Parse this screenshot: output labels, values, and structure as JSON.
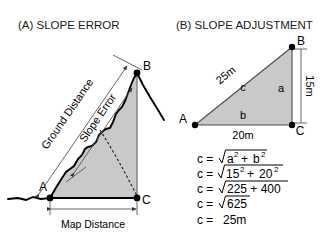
{
  "figure": {
    "background_color": "#ffffff",
    "fill_color": "#c9c9c9",
    "line_color": "#000000"
  },
  "panel_a": {
    "title": "(A) SLOPE ERROR",
    "labels": {
      "ground_distance": "Ground Distance",
      "slope_error": "Slope Error",
      "map_distance": "Map Distance",
      "point_a": "A",
      "point_b": "B",
      "point_c": "C"
    }
  },
  "panel_b": {
    "title": "(B) SLOPE ADJUSTMENT",
    "labels": {
      "point_a": "A",
      "point_b": "B",
      "point_c": "C",
      "side_c_letter": "c",
      "side_a_letter": "a",
      "side_b_letter": "b",
      "hypotenuse_length": "25m",
      "vertical_length": "15m",
      "base_length": "20m"
    },
    "equations": [
      {
        "lhs": "c =",
        "radicand": "a² + b²",
        "plain": "c = √(a² + b²)"
      },
      {
        "lhs": "c =",
        "radicand": "15² + 20²",
        "plain": "c = √(15² + 20²)"
      },
      {
        "lhs": "c =",
        "radicand": "225 + 400",
        "plain": "c = √(225 + 400)"
      },
      {
        "lhs": "c =",
        "radicand": "625",
        "plain": "c = √625"
      },
      {
        "lhs": "c =",
        "radicand": "25m",
        "plain": "c = 25m"
      }
    ],
    "equation_parts": {
      "e1_lhs": "c =",
      "e1_base1": "a",
      "e1_sup1": "2",
      "e1_plus": "+",
      "e1_base2": "b",
      "e1_sup2": "2",
      "e2_lhs": "c =",
      "e2_base1": "15",
      "e2_sup1": "2",
      "e2_plus": "+",
      "e2_base2": "20",
      "e2_sup2": "2",
      "e3_lhs": "c =",
      "e3_body": "225 + 400",
      "e4_lhs": "c =",
      "e4_body": "625",
      "e5_lhs": "c =",
      "e5_body": "25m"
    }
  }
}
